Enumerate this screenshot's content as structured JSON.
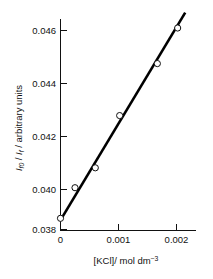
{
  "chart_data": {
    "type": "scatter",
    "title": "",
    "subtitle": "",
    "xlabel_parts": {
      "main": "[KCl]/ mol dm",
      "superscript": "−3"
    },
    "xlabel": "[KCl]/ mol dm−3",
    "ylabel_parts": {
      "symbol1": "I",
      "symbol1_sub": "f0",
      "separator1": " / ",
      "symbol2": "I",
      "symbol2_sub": "f",
      "tail": " / arbitrary units"
    },
    "ylabel": "If0 / If / arbitrary units",
    "xlim": [
      0.0,
      0.00222
    ],
    "ylim": [
      0.0379,
      0.04685
    ],
    "xticks": [
      0,
      0.001,
      0.002
    ],
    "xtick_labels": [
      "0",
      "0.001",
      "0.002"
    ],
    "yticks": [
      0.038,
      0.04,
      0.042,
      0.044,
      0.046
    ],
    "ytick_labels": [
      "0.038",
      "0.040",
      "0.042",
      "0.044",
      "0.046"
    ],
    "grid": false,
    "legend": "none",
    "marker": "open-circle",
    "series": [
      {
        "name": "Stern-Volmer data",
        "x": [
          0.0,
          0.00025,
          0.0006,
          0.00102,
          0.00167,
          0.00202
        ],
        "y": [
          0.03845,
          0.03968,
          0.04048,
          0.04258,
          0.04467,
          0.0461
        ]
      }
    ],
    "fit_line": {
      "name": "linear fit",
      "x_start": 0.0,
      "y_start": 0.03838,
      "x_end": 0.00215,
      "y_end": 0.04672,
      "slope": 3.879,
      "intercept": 0.03838
    },
    "colors": {
      "axis": "#111111",
      "line": "#000000",
      "marker_fill": "#ffffff",
      "marker_stroke": "#111111",
      "background": "#ffffff"
    }
  }
}
